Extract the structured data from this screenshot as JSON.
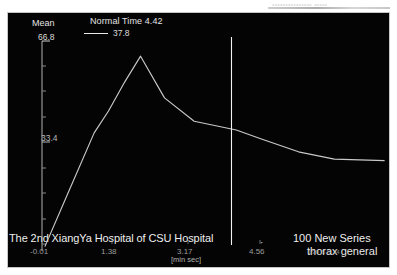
{
  "viewer": {
    "background_color": "#ffffff",
    "plot_background_color": "#040404",
    "frame_border_color": "#c6c6c6",
    "curve_color": "#c9c9c9",
    "cursor_color": "#f2f2f2",
    "axis_color": "#b9b9b9"
  },
  "axes": {
    "y_label": "Mean",
    "y_tick_top": "66.8",
    "y_tick_mid": "33.4",
    "x_unit_label": "[min sec]",
    "x_ticks": [
      "-0.01",
      "1.38",
      "3.17",
      "4.56"
    ]
  },
  "title": {
    "main": "Normal Time 4.42"
  },
  "legend": {
    "series_value": "37.8"
  },
  "overlay": {
    "institution": "The 2nd XiangYa Hospital of CSU Hospital",
    "separator": "·",
    "series": "100 New Series",
    "protocol": "thorax general",
    "small_tags": "190  5    814  .."
  },
  "ghost_top": {
    "clipped_text": "•••••••••••••••  •••••"
  },
  "chart_data": {
    "type": "line",
    "title": "Normal Time 4.42",
    "xlabel": "[min sec]",
    "ylabel": "Mean",
    "grid": false,
    "legend_position": "top-center",
    "legend_entries": [
      "37.8"
    ],
    "xlim": [
      -0.01,
      7.2
    ],
    "ylim": [
      0,
      72
    ],
    "x_tick_labels": [
      "-0.01",
      "1.38",
      "3.17",
      "4.56"
    ],
    "x_tick_values": [
      -0.01,
      1.38,
      3.17,
      4.56
    ],
    "y_tick_labels": [
      "33.4",
      "66.8"
    ],
    "y_tick_values": [
      33.4,
      66.8
    ],
    "cursor_line_x": 3.95,
    "series": [
      {
        "name": "37.8",
        "color": "#c9c9c9",
        "x": [
          0.05,
          0.55,
          1.08,
          1.38,
          1.72,
          2.05,
          2.55,
          3.17,
          4.05,
          4.56,
          5.35,
          6.1,
          7.15
        ],
        "y": [
          1.5,
          20.5,
          40.5,
          48.0,
          58.0,
          66.8,
          52.5,
          44.5,
          41.5,
          38.5,
          34.0,
          31.5,
          31.0
        ]
      }
    ]
  }
}
